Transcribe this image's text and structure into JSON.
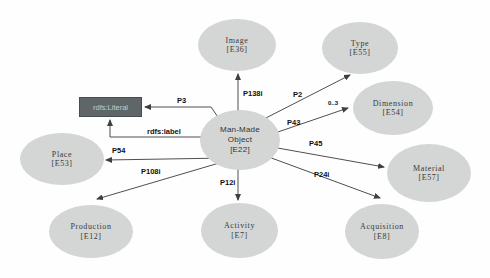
{
  "diagram": {
    "nodes": {
      "image": {
        "label": "Image",
        "code": "[E36]"
      },
      "type": {
        "label": "Type",
        "code": "[E55]"
      },
      "dimension": {
        "label": "Dimension",
        "code": "[E54]"
      },
      "material": {
        "label": "Material",
        "code": "[E57]"
      },
      "acquisition": {
        "label": "Acquisition",
        "code": "[E8]"
      },
      "activity": {
        "label": "Activity",
        "code": "[E7]"
      },
      "production": {
        "label": "Production",
        "code": "[E12]"
      },
      "place": {
        "label": "Place",
        "code": "[E53]"
      },
      "man_made_object": {
        "lines": [
          "Man-Made",
          "Object",
          "[E22]"
        ]
      }
    },
    "literal": {
      "label": "rdfs:Literal"
    },
    "edges": {
      "p138i": {
        "label": "P138i"
      },
      "p3": {
        "label": "P3"
      },
      "rdfs_label": {
        "label": "rdfs:label"
      },
      "p54": {
        "label": "P54"
      },
      "p108i": {
        "label": "P108i"
      },
      "p12i": {
        "label": "P12i"
      },
      "p2": {
        "label": "P2"
      },
      "p43": {
        "label": "P43",
        "cardinality": "0..3"
      },
      "p45": {
        "label": "P45"
      },
      "p24i": {
        "label": "P24i"
      }
    },
    "colors": {
      "node_fill": "#d3d6d4",
      "literal_fill": "#5e6668",
      "literal_border": "#454d4f",
      "literal_text": "#c7cbca",
      "line": "#4f4f4f",
      "label_text": "#101010",
      "background": "#fefefe"
    }
  }
}
